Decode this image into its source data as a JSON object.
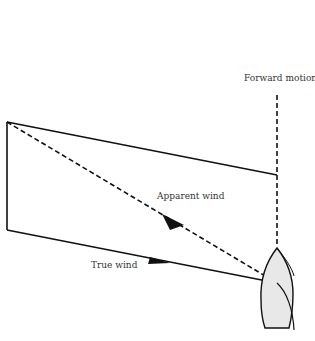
{
  "diagram": {
    "type": "wind vector diagram",
    "labels": {
      "forward_motion": "Forward motion",
      "apparent_wind": "Apparent wind",
      "true_wind": "True wind"
    },
    "colors": {
      "line": "#111111",
      "boat_fill": "#e8e8e8",
      "text": "#333333"
    },
    "elements": [
      {
        "name": "true-wind-vector",
        "style": "solid",
        "arrow": true
      },
      {
        "name": "apparent-wind-vector",
        "style": "dashed",
        "arrow": true
      },
      {
        "name": "forward-motion-line",
        "style": "dashed",
        "arrow": false
      },
      {
        "name": "boat",
        "shape": "hull outline, bow up"
      }
    ]
  }
}
